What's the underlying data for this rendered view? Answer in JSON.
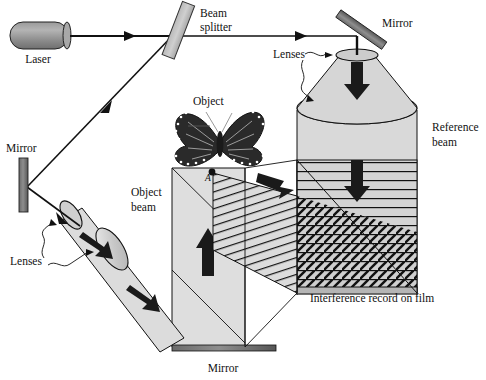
{
  "figure": {
    "title_visible": false,
    "type": "optical-holography-setup-diagram",
    "width": 486,
    "height": 380,
    "background": "#ffffff"
  },
  "palette": {
    "beam_fill": "#d3d3d3",
    "beam_fill_light": "#dcdcdc",
    "component_gray": "#8a8a8a",
    "component_dark": "#4a4a4a",
    "line": "#111111",
    "arrow": "#1a1a1a",
    "film_band": "#c9c9c9",
    "white": "#ffffff"
  },
  "labels": [
    {
      "id": "laser",
      "text": "Laser",
      "x": 38,
      "y": 63,
      "anchor": "middle",
      "style": "plain"
    },
    {
      "id": "beam-splitter-1",
      "text": "Beam",
      "x": 200,
      "y": 17,
      "anchor": "start",
      "style": "plain"
    },
    {
      "id": "beam-splitter-2",
      "text": "splitter",
      "x": 200,
      "y": 31,
      "anchor": "start",
      "style": "plain"
    },
    {
      "id": "mirror-top-right",
      "text": "Mirror",
      "x": 382,
      "y": 27,
      "anchor": "start",
      "style": "plain"
    },
    {
      "id": "lenses-right",
      "text": "Lenses",
      "x": 273,
      "y": 58,
      "anchor": "start",
      "style": "plain"
    },
    {
      "id": "object",
      "text": "Object",
      "x": 193,
      "y": 105,
      "anchor": "start",
      "style": "plain"
    },
    {
      "id": "reference-beam-1",
      "text": "Reference",
      "x": 432,
      "y": 131,
      "anchor": "start",
      "style": "plain"
    },
    {
      "id": "reference-beam-2",
      "text": "beam",
      "x": 432,
      "y": 146,
      "anchor": "start",
      "style": "plain"
    },
    {
      "id": "mirror-left",
      "text": "Mirror",
      "x": 6,
      "y": 152,
      "anchor": "start",
      "style": "plain"
    },
    {
      "id": "object-beam-1",
      "text": "Object",
      "x": 131,
      "y": 196,
      "anchor": "start",
      "style": "plain"
    },
    {
      "id": "object-beam-2",
      "text": "beam",
      "x": 131,
      "y": 211,
      "anchor": "start",
      "style": "plain"
    },
    {
      "id": "lenses-left",
      "text": "Lenses",
      "x": 10,
      "y": 265,
      "anchor": "start",
      "style": "plain"
    },
    {
      "id": "film-caption",
      "text": "Interference record on film",
      "x": 310,
      "y": 302,
      "anchor": "start",
      "style": "plain"
    },
    {
      "id": "mirror-bottom",
      "text": "Mirror",
      "x": 223,
      "y": 372,
      "anchor": "middle",
      "style": "plain"
    },
    {
      "id": "point-a",
      "text": "A",
      "x": 208,
      "y": 181,
      "anchor": "middle",
      "style": "italic"
    }
  ],
  "components": {
    "laser": {
      "name": "laser-tube",
      "x": 8,
      "y": 22,
      "w": 62,
      "h": 27
    },
    "beam_splitter": {
      "name": "beam-splitter-plate",
      "cx": 179,
      "cy": 30,
      "w": 13,
      "h": 58,
      "rotate": 22
    },
    "mirror_left": {
      "name": "mirror-left-plate",
      "x": 19,
      "y": 158,
      "w": 8,
      "h": 54
    },
    "mirror_top_right": {
      "name": "mirror-top-right-plate",
      "cx": 362,
      "cy": 30,
      "w": 9,
      "h": 56,
      "rotate": 55
    },
    "mirror_bottom": {
      "name": "mirror-bottom-plate",
      "x": 172,
      "y": 345,
      "w": 104,
      "h": 6
    },
    "film": {
      "name": "film-plate",
      "x": 297,
      "y": 160,
      "w": 120,
      "h": 133
    },
    "reference_cone": {
      "name": "reference-beam-cone",
      "apex_y": 55,
      "base_y": 110,
      "cx": 357
    },
    "reference_cylinder": {
      "name": "reference-beam-cylinder",
      "x": 297,
      "y": 105,
      "w": 120,
      "h": 190
    }
  },
  "beam_paths": {
    "laser_to_splitter": {
      "from": [
        70,
        36
      ],
      "to": [
        176,
        36
      ]
    },
    "splitter_to_right_mirror": {
      "from": [
        182,
        36
      ],
      "to": [
        356,
        36
      ]
    },
    "splitter_to_left_mirror": {
      "from": [
        176,
        33
      ],
      "to": [
        26,
        190
      ]
    },
    "left_mirror_to_lens": {
      "from": [
        26,
        190
      ],
      "to": [
        78,
        230
      ]
    }
  },
  "arrows": [
    {
      "name": "beam-arrow-laser-right",
      "x": 128,
      "y": 36,
      "dir": "right",
      "size": "small"
    },
    {
      "name": "beam-arrow-upper-right",
      "x": 300,
      "y": 36,
      "dir": "right",
      "size": "small"
    },
    {
      "name": "beam-arrow-down-left",
      "x": 104,
      "y": 109,
      "dir": "down-left",
      "size": "small"
    },
    {
      "name": "beam-arrow-to-lens",
      "x": 63,
      "y": 219,
      "dir": "down-right",
      "size": "small"
    },
    {
      "name": "reference-arrow-top",
      "x": 357,
      "y": 72,
      "dir": "down",
      "size": "big"
    },
    {
      "name": "reference-arrow-mid",
      "x": 357,
      "y": 170,
      "dir": "down",
      "size": "big"
    },
    {
      "name": "object-beam-arrow-up",
      "x": 207,
      "y": 250,
      "dir": "up",
      "size": "big"
    },
    {
      "name": "object-beam-arrow-diag1",
      "x": 95,
      "y": 248,
      "dir": "down-right",
      "size": "big"
    },
    {
      "name": "object-beam-arrow-diag2",
      "x": 140,
      "y": 290,
      "dir": "down-right",
      "size": "big"
    },
    {
      "name": "object-beam-arrow-to-film",
      "x": 273,
      "y": 183,
      "dir": "right-down",
      "size": "big"
    }
  ],
  "film_patterns": {
    "reference_fringes": "horizontal-lines",
    "object_fringes": "diagonal-lines",
    "overlap_region": "cross-hatch"
  },
  "object": {
    "name": "butterfly",
    "cx": 220,
    "cy": 140,
    "point_a": {
      "x": 212,
      "y": 172
    }
  }
}
